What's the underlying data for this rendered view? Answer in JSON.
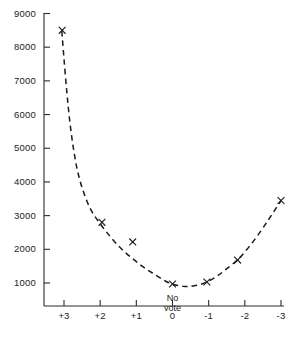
{
  "chart_data": {
    "type": "line",
    "title": "",
    "subtitle": "",
    "xlabel": "",
    "ylabel": "",
    "xlim": [
      3.5,
      -3.5
    ],
    "ylim": [
      0,
      9000
    ],
    "x_tick_labels": [
      "+3",
      "+2",
      "+1",
      "0",
      "-1",
      "-2",
      "-3"
    ],
    "x_tick_values": [
      3,
      2,
      1,
      0,
      -1,
      -2,
      -3
    ],
    "y_tick_labels": [
      "9000",
      "8000",
      "7000",
      "6000",
      "5000",
      "4000",
      "3000",
      "2000",
      "1000"
    ],
    "y_tick_values": [
      9000,
      8000,
      7000,
      6000,
      5000,
      4000,
      3000,
      2000,
      1000
    ],
    "grid": false,
    "legend": false,
    "x_axis_inverted": true,
    "series": [
      {
        "name": "data points",
        "marker": "x",
        "linestyle": "none",
        "points": [
          {
            "x": 3.05,
            "y": 8500
          },
          {
            "x": 1.95,
            "y": 2800
          },
          {
            "x": 1.1,
            "y": 2220
          },
          {
            "x": 0.0,
            "y": 970
          },
          {
            "x": -0.95,
            "y": 1030
          },
          {
            "x": -1.8,
            "y": 1680
          },
          {
            "x": -3.0,
            "y": 3450
          }
        ]
      },
      {
        "name": "fitted curve",
        "marker": "none",
        "linestyle": "dashed",
        "points": [
          {
            "x": 3.06,
            "y": 8480
          },
          {
            "x": 3.0,
            "y": 7650
          },
          {
            "x": 2.92,
            "y": 6650
          },
          {
            "x": 2.84,
            "y": 5800
          },
          {
            "x": 2.74,
            "y": 5000
          },
          {
            "x": 2.62,
            "y": 4300
          },
          {
            "x": 2.46,
            "y": 3700
          },
          {
            "x": 2.26,
            "y": 3180
          },
          {
            "x": 2.0,
            "y": 2760
          },
          {
            "x": 1.7,
            "y": 2350
          },
          {
            "x": 1.4,
            "y": 2000
          },
          {
            "x": 1.1,
            "y": 1720
          },
          {
            "x": 0.8,
            "y": 1470
          },
          {
            "x": 0.5,
            "y": 1260
          },
          {
            "x": 0.2,
            "y": 1060
          },
          {
            "x": 0.0,
            "y": 965
          },
          {
            "x": -0.3,
            "y": 900
          },
          {
            "x": -0.5,
            "y": 900
          },
          {
            "x": -0.75,
            "y": 950
          },
          {
            "x": -0.95,
            "y": 1030
          },
          {
            "x": -1.2,
            "y": 1180
          },
          {
            "x": -1.45,
            "y": 1380
          },
          {
            "x": -1.8,
            "y": 1690
          },
          {
            "x": -2.1,
            "y": 2050
          },
          {
            "x": -2.4,
            "y": 2480
          },
          {
            "x": -2.65,
            "y": 2870
          },
          {
            "x": -2.85,
            "y": 3200
          },
          {
            "x": -3.0,
            "y": 3440
          }
        ]
      }
    ],
    "annotations": [
      {
        "name": "no-vote-label",
        "text_lines": [
          "No",
          "vote"
        ],
        "x": 0,
        "y": 560
      }
    ],
    "colors": {
      "axis": "#2b2b2b",
      "curve": "#1a1a1a",
      "marker": "#1a1a1a",
      "background": "#ffffff"
    }
  }
}
